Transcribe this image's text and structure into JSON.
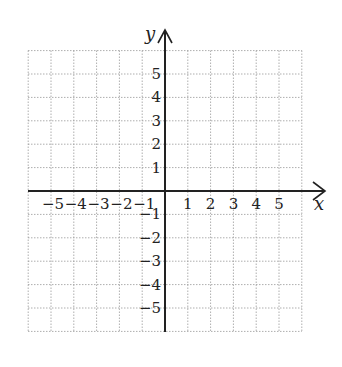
{
  "chart_data": {
    "type": "scatter",
    "title": "",
    "xlabel": "x",
    "ylabel": "y",
    "xlim": [
      -6,
      6
    ],
    "ylim": [
      -6,
      6
    ],
    "grid": true,
    "grid_style": "dotted",
    "x_ticks": [
      -5,
      -4,
      -3,
      -2,
      -1,
      1,
      2,
      3,
      4,
      5
    ],
    "y_ticks": [
      5,
      4,
      3,
      2,
      1,
      -1,
      -2,
      -3,
      -4,
      -5
    ],
    "x_tick_labels": [
      "−5",
      "−4",
      "−3",
      "−2",
      "−1",
      "1",
      "2",
      "3",
      "4",
      "5"
    ],
    "y_tick_labels": [
      "5",
      "4",
      "3",
      "2",
      "1",
      "−1",
      "−2",
      "−3",
      "−4",
      "−5"
    ],
    "series": [],
    "colors": {
      "axis": "#222222",
      "grid": "#9a9a9a",
      "background": "#ffffff"
    }
  }
}
